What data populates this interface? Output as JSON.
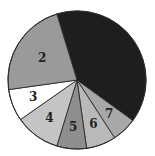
{
  "chart_data": {
    "type": "pie",
    "title": "",
    "start_angle_deg": -17,
    "direction": "clockwise",
    "center": [
      77,
      80
    ],
    "radius": 69,
    "slices": [
      {
        "label": "1",
        "show_label": false,
        "percent": 39.7,
        "degrees": 143,
        "color": "#1e1e1e"
      },
      {
        "label": "7",
        "show_label": true,
        "percent": 5.8,
        "degrees": 21,
        "color": "#a8a8a8"
      },
      {
        "label": "6",
        "show_label": true,
        "percent": 6.9,
        "degrees": 25,
        "color": "#b9b9b9"
      },
      {
        "label": "5",
        "show_label": true,
        "percent": 6.9,
        "degrees": 25,
        "color": "#8e8e8e"
      },
      {
        "label": "4",
        "show_label": true,
        "percent": 10.6,
        "degrees": 38,
        "color": "#c4c4c4"
      },
      {
        "label": "3",
        "show_label": true,
        "percent": 7.5,
        "degrees": 27,
        "color": "#ffffff"
      },
      {
        "label": "2",
        "show_label": true,
        "percent": 22.5,
        "degrees": 81,
        "color": "#9a9a9a"
      }
    ],
    "legend": null,
    "grid": false
  }
}
